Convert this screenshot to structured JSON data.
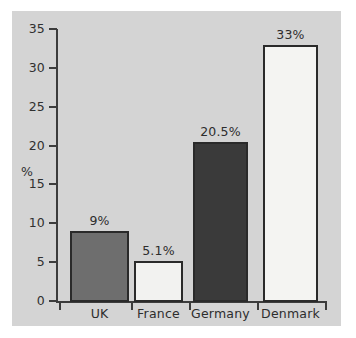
{
  "chart_data": {
    "type": "bar",
    "title": "",
    "xlabel": "",
    "ylabel": "%",
    "categories": [
      "UK",
      "France",
      "Germany",
      "Denmark"
    ],
    "values": [
      9,
      5.1,
      20.5,
      33
    ],
    "data_labels": [
      "9%",
      "5.1%",
      "20.5%",
      "33%"
    ],
    "ylim": [
      0,
      35
    ],
    "ytick_values": [
      0,
      5,
      10,
      15,
      20,
      25,
      30,
      35
    ],
    "ytick_labels": [
      "0",
      "5",
      "10",
      "15",
      "20",
      "25",
      "30",
      "35"
    ],
    "grid": false,
    "legend": false,
    "bar_colors": [
      "#6e6e6e",
      "#f2f2f0",
      "#3a3a3a",
      "#f4f4f2"
    ],
    "bar_edge_color": "#2a2a2a",
    "plot_background": "#d4d4d4",
    "figure_background": "#ffffff",
    "text_color": "#2d2d2d"
  }
}
